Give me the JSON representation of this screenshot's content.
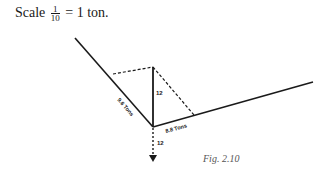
{
  "scale": {
    "prefix": "Scale",
    "numerator": "1",
    "denominator": "10",
    "suffix": "= 1 ton."
  },
  "diagram": {
    "left_member_label": "9.6 Tons",
    "right_member_label": "8.8 Tons",
    "vertical_label": "12",
    "load_label": "12"
  },
  "caption": "Fig. 2.10"
}
